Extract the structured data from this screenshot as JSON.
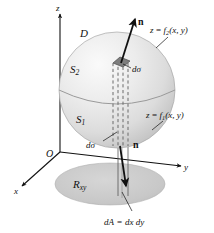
{
  "figure": {
    "background_color": "#ffffff",
    "ink_color": "#111111"
  },
  "axes": {
    "origin_label": "O",
    "z_label": "z",
    "y_label": "y",
    "x_label": "x"
  },
  "region": {
    "solid_label": "D",
    "upper_surface_label": "S",
    "upper_surface_sub": "2",
    "lower_surface_label": "S",
    "lower_surface_sub": "1",
    "projection_label": "R",
    "projection_sub": "xy",
    "sphere_color_light": "#f2f2f2",
    "sphere_color_mid": "#d8d8d8",
    "sphere_color_dark": "#b4b4b4",
    "ellipse_color": "#c9c9c9"
  },
  "annotations": {
    "upper_surface_equation_lhs": "z",
    "upper_surface_equation_eq": "=",
    "upper_surface_equation_f": "f",
    "upper_surface_equation_sub": "2",
    "upper_surface_equation_args": "(x, y)",
    "lower_surface_equation_lhs": "z",
    "lower_surface_equation_eq": "=",
    "lower_surface_equation_f": "f",
    "lower_surface_equation_sub": "1",
    "lower_surface_equation_args": "(x, y)",
    "normal_upper_label": "n",
    "normal_lower_label": "n",
    "surface_element_upper": "dσ",
    "surface_element_lower": "dσ",
    "area_element_lhs": "dA",
    "area_element_eq": "=",
    "area_element_rhs": "dx dy"
  }
}
